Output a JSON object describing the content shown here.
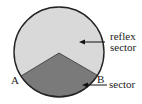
{
  "diagram": {
    "type": "circle-sector",
    "labels": {
      "reflex_line1": "reflex",
      "reflex_line2": "sector",
      "sector": "sector",
      "point_a": "A",
      "point_b": "B"
    },
    "colors": {
      "reflex_fill": "#d9d9d9",
      "sector_fill": "#7a7a7a",
      "outline": "#222222"
    }
  }
}
